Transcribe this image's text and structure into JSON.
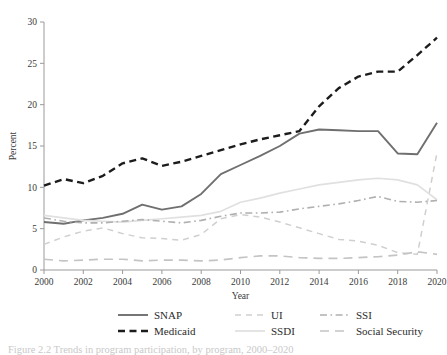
{
  "chart_data": {
    "type": "line",
    "title": "",
    "xlabel": "Year",
    "ylabel": "Percent",
    "xlim": [
      2000,
      2020
    ],
    "ylim": [
      0,
      30
    ],
    "ytick_labels": [
      "0",
      "5",
      "10",
      "15",
      "20",
      "25",
      "30"
    ],
    "yticks": [
      0,
      5,
      10,
      15,
      20,
      25,
      30
    ],
    "xtick_labels": [
      "2000",
      "2002",
      "2004",
      "2006",
      "2008",
      "2010",
      "2012",
      "2014",
      "2016",
      "2018",
      "2020"
    ],
    "xticks": [
      2000,
      2002,
      2004,
      2006,
      2008,
      2010,
      2012,
      2014,
      2016,
      2018,
      2020
    ],
    "grid": false,
    "legend_position": "bottom",
    "x": [
      2000,
      2001,
      2002,
      2003,
      2004,
      2005,
      2006,
      2007,
      2008,
      2009,
      2010,
      2011,
      2012,
      2013,
      2014,
      2015,
      2016,
      2017,
      2018,
      2019,
      2020
    ],
    "series": [
      {
        "name": "SNAP",
        "style": "solid",
        "color": "#6f6f6f",
        "width": 1.9,
        "values": [
          5.8,
          5.6,
          6.0,
          6.3,
          6.8,
          7.9,
          7.3,
          7.7,
          9.2,
          11.6,
          12.7,
          13.8,
          15.0,
          16.5,
          17.0,
          16.9,
          16.8,
          16.8,
          14.1,
          14.0,
          17.8
        ]
      },
      {
        "name": "Medicaid",
        "style": "dashed",
        "color": "#1c1c1c",
        "width": 2.4,
        "values": [
          10.2,
          11.0,
          10.5,
          11.4,
          12.9,
          13.5,
          12.6,
          13.1,
          13.8,
          14.5,
          15.2,
          15.8,
          16.3,
          16.8,
          19.8,
          22.0,
          23.4,
          24.0,
          24.0,
          26.0,
          28.1
        ]
      },
      {
        "name": "UI",
        "style": "dashed-light",
        "color": "#cfcfcf",
        "width": 1.5,
        "values": [
          3.1,
          4.0,
          4.7,
          5.1,
          4.4,
          3.9,
          3.8,
          3.6,
          4.3,
          6.2,
          6.7,
          6.4,
          5.8,
          5.1,
          4.4,
          3.7,
          3.5,
          3.0,
          2.1,
          1.9,
          14.2
        ]
      },
      {
        "name": "SSDI",
        "style": "solid-light",
        "color": "#e0e0e0",
        "width": 1.7,
        "values": [
          6.6,
          6.3,
          6.0,
          5.9,
          5.8,
          6.0,
          6.2,
          6.4,
          6.6,
          7.1,
          8.2,
          8.7,
          9.3,
          9.8,
          10.3,
          10.6,
          10.9,
          11.1,
          10.9,
          10.3,
          8.5
        ]
      },
      {
        "name": "SSI",
        "style": "dash-dot",
        "color": "#b0b0b0",
        "width": 1.6,
        "values": [
          6.3,
          5.9,
          5.7,
          5.7,
          5.9,
          6.1,
          5.9,
          5.7,
          6.0,
          6.5,
          6.9,
          6.9,
          7.0,
          7.4,
          7.7,
          8.0,
          8.4,
          8.9,
          8.3,
          8.2,
          8.4
        ]
      },
      {
        "name": "Social Security",
        "style": "long-dash",
        "color": "#c4c4c4",
        "width": 1.7,
        "values": [
          1.3,
          1.1,
          1.2,
          1.3,
          1.3,
          1.1,
          1.2,
          1.2,
          1.1,
          1.2,
          1.5,
          1.7,
          1.7,
          1.5,
          1.4,
          1.4,
          1.5,
          1.6,
          1.8,
          2.2,
          1.9
        ]
      }
    ]
  },
  "legend": {
    "entries": [
      {
        "label": "SNAP",
        "series": 0
      },
      {
        "label": "UI",
        "series": 2
      },
      {
        "label": "SSI",
        "series": 4
      },
      {
        "label": "Medicaid",
        "series": 1
      },
      {
        "label": "SSDI",
        "series": 3
      },
      {
        "label": "Social Security",
        "series": 5
      }
    ]
  },
  "caption": {
    "text": "Figure 2.2  Trends in program participation, by program, 2000–2020"
  }
}
